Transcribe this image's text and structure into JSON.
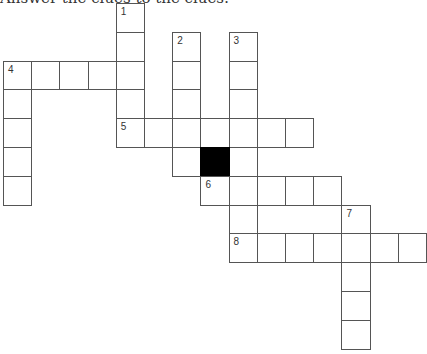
{
  "instructions": "Answer the clues to the clues:",
  "grid": {
    "origin": [
      3,
      3
    ],
    "cell_step": [
      28.2,
      28.8
    ],
    "cells": [
      {
        "c": 4,
        "r": 0,
        "num": "1"
      },
      {
        "c": 4,
        "r": 1
      },
      {
        "c": 4,
        "r": 2
      },
      {
        "c": 4,
        "r": 3
      },
      {
        "c": 4,
        "r": 4,
        "num": "5"
      },
      {
        "c": 6,
        "r": 1,
        "num": "2"
      },
      {
        "c": 6,
        "r": 2
      },
      {
        "c": 6,
        "r": 3
      },
      {
        "c": 6,
        "r": 4
      },
      {
        "c": 6,
        "r": 5
      },
      {
        "c": 8,
        "r": 1,
        "num": "3"
      },
      {
        "c": 8,
        "r": 2
      },
      {
        "c": 8,
        "r": 3
      },
      {
        "c": 8,
        "r": 4
      },
      {
        "c": 8,
        "r": 5
      },
      {
        "c": 8,
        "r": 6
      },
      {
        "c": 8,
        "r": 7
      },
      {
        "c": 8,
        "r": 8,
        "num": "8"
      },
      {
        "c": 0,
        "r": 2,
        "num": "4"
      },
      {
        "c": 1,
        "r": 2
      },
      {
        "c": 2,
        "r": 2
      },
      {
        "c": 3,
        "r": 2
      },
      {
        "c": 0,
        "r": 3
      },
      {
        "c": 0,
        "r": 4
      },
      {
        "c": 0,
        "r": 5
      },
      {
        "c": 0,
        "r": 6
      },
      {
        "c": 5,
        "r": 4
      },
      {
        "c": 7,
        "r": 4
      },
      {
        "c": 9,
        "r": 4
      },
      {
        "c": 10,
        "r": 4
      },
      {
        "c": 7,
        "r": 5,
        "black": true
      },
      {
        "c": 7,
        "r": 6,
        "num": "6"
      },
      {
        "c": 9,
        "r": 6
      },
      {
        "c": 10,
        "r": 6
      },
      {
        "c": 11,
        "r": 6
      },
      {
        "c": 12,
        "r": 7,
        "num": "7"
      },
      {
        "c": 12,
        "r": 9
      },
      {
        "c": 12,
        "r": 10
      },
      {
        "c": 12,
        "r": 11
      },
      {
        "c": 9,
        "r": 8
      },
      {
        "c": 10,
        "r": 8
      },
      {
        "c": 11,
        "r": 8
      },
      {
        "c": 12,
        "r": 8
      },
      {
        "c": 13,
        "r": 8
      },
      {
        "c": 14,
        "r": 8
      }
    ]
  },
  "clues": {
    "across": [
      "4",
      "5",
      "6",
      "8"
    ],
    "down": [
      "1",
      "2",
      "3",
      "4",
      "7"
    ]
  }
}
